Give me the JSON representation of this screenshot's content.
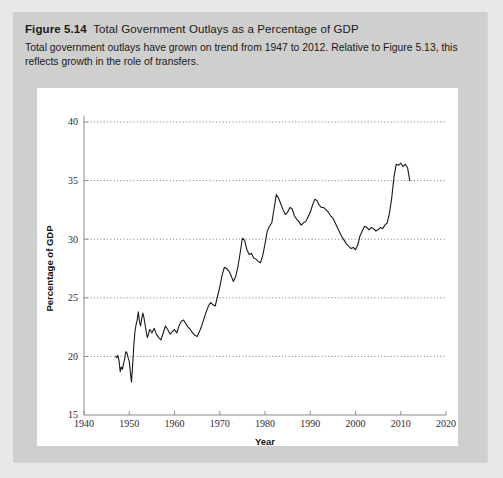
{
  "figure": {
    "number": "Figure 5.14",
    "title": "Total Government Outlays as a Percentage of GDP",
    "caption": "Total government outlays have grown on trend from 1947 to 2012. Relative to Figure 5.13, this reflects growth in the role of transfers."
  },
  "colors": {
    "page_background": "#e8e8e6",
    "panel_background": "#cfcfcd",
    "card_background": "#ffffff",
    "line": "#1a1a1a",
    "axis": "#888888",
    "gridline": "#555555",
    "text": "#1a1a1a"
  },
  "chart_data": {
    "type": "line",
    "title": "Total Government Outlays as a Percentage of GDP",
    "xlabel": "Year",
    "ylabel": "Percentage of GDP",
    "xlim": [
      1940,
      2020
    ],
    "ylim": [
      15,
      40
    ],
    "xticks": [
      1940,
      1950,
      1960,
      1970,
      1980,
      1990,
      2000,
      2010,
      2020
    ],
    "yticks": [
      15,
      20,
      25,
      30,
      35,
      40
    ],
    "xticklabels": [
      "1940",
      "1950",
      "1960",
      "1970",
      "1980",
      "1990",
      "2000",
      "2010",
      "2020"
    ],
    "yticklabels": [
      "15",
      "20",
      "25",
      "30",
      "35",
      "40"
    ],
    "grid": "horizontal-dotted",
    "legend": "none",
    "series": [
      {
        "name": "Total government outlays (% of GDP)",
        "x": [
          1947,
          1947.25,
          1947.5,
          1947.75,
          1948,
          1948.25,
          1948.5,
          1948.75,
          1949,
          1949.25,
          1949.5,
          1949.75,
          1950,
          1950.25,
          1950.5,
          1950.75,
          1951,
          1951.25,
          1951.5,
          1951.75,
          1952,
          1952.25,
          1952.5,
          1952.75,
          1953,
          1953.25,
          1953.5,
          1953.75,
          1954,
          1954.25,
          1954.5,
          1954.75,
          1955,
          1955.5,
          1956,
          1956.5,
          1957,
          1957.5,
          1958,
          1958.5,
          1959,
          1959.5,
          1960,
          1960.5,
          1961,
          1961.5,
          1962,
          1962.5,
          1963,
          1963.5,
          1964,
          1964.5,
          1965,
          1965.5,
          1966,
          1966.5,
          1967,
          1967.5,
          1968,
          1968.5,
          1969,
          1969.5,
          1970,
          1970.5,
          1971,
          1971.5,
          1972,
          1972.5,
          1973,
          1973.5,
          1974,
          1974.5,
          1975,
          1975.5,
          1976,
          1976.5,
          1977,
          1977.5,
          1978,
          1978.5,
          1979,
          1979.5,
          1980,
          1980.5,
          1981,
          1981.5,
          1982,
          1982.5,
          1983,
          1983.5,
          1984,
          1984.5,
          1985,
          1985.5,
          1986,
          1986.5,
          1987,
          1987.5,
          1988,
          1988.5,
          1989,
          1989.5,
          1990,
          1990.5,
          1991,
          1991.5,
          1992,
          1992.5,
          1993,
          1993.5,
          1994,
          1994.5,
          1995,
          1995.5,
          1996,
          1996.5,
          1997,
          1997.5,
          1998,
          1998.5,
          1999,
          1999.5,
          2000,
          2000.5,
          2001,
          2001.5,
          2002,
          2002.5,
          2003,
          2003.5,
          2004,
          2004.5,
          2005,
          2005.5,
          2006,
          2006.5,
          2007,
          2007.5,
          2008,
          2008.5,
          2009,
          2009.5,
          2010,
          2010.5,
          2011,
          2011.5,
          2012
        ],
        "y": [
          20.0,
          19.9,
          20.1,
          19.6,
          18.7,
          19.1,
          18.9,
          19.4,
          19.8,
          20.4,
          20.3,
          19.9,
          19.6,
          18.6,
          17.8,
          19.3,
          20.9,
          22.1,
          22.7,
          23.1,
          23.8,
          23.0,
          22.6,
          23.2,
          23.7,
          23.3,
          22.7,
          22.1,
          21.6,
          21.9,
          22.3,
          22.2,
          22.0,
          22.4,
          21.9,
          21.6,
          21.4,
          22.0,
          22.6,
          22.3,
          21.9,
          22.1,
          22.3,
          22.0,
          22.6,
          23.0,
          23.1,
          22.8,
          22.5,
          22.3,
          22.0,
          21.8,
          21.7,
          22.1,
          22.6,
          23.2,
          23.8,
          24.3,
          24.6,
          24.4,
          24.3,
          25.1,
          25.9,
          26.9,
          27.6,
          27.5,
          27.3,
          26.9,
          26.4,
          26.8,
          27.6,
          28.8,
          30.1,
          29.9,
          29.1,
          28.7,
          28.8,
          28.4,
          28.3,
          28.1,
          28.0,
          28.6,
          29.6,
          30.7,
          31.1,
          31.4,
          32.6,
          33.8,
          33.5,
          33.0,
          32.5,
          32.1,
          32.3,
          32.7,
          32.6,
          32.0,
          31.7,
          31.5,
          31.2,
          31.4,
          31.5,
          31.9,
          32.3,
          32.9,
          33.4,
          33.3,
          32.9,
          32.7,
          32.7,
          32.5,
          32.3,
          32.0,
          31.8,
          31.4,
          31.0,
          30.6,
          30.2,
          29.9,
          29.6,
          29.4,
          29.2,
          29.3,
          29.1,
          29.5,
          30.3,
          30.7,
          31.1,
          31.0,
          30.8,
          31.0,
          30.9,
          30.7,
          30.8,
          31.0,
          30.9,
          31.2,
          31.4,
          32.2,
          33.5,
          35.3,
          36.4,
          36.3,
          36.5,
          36.2,
          36.4,
          36.1,
          35.0
        ]
      }
    ],
    "annotations": []
  }
}
